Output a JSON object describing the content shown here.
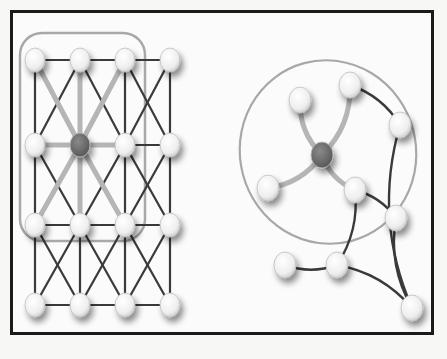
{
  "figure": {
    "background_text": "",
    "colors": {
      "frame": "#1a1a1a",
      "edge_dark": "#3a3a3a",
      "edge_highlight": "#b5b5b5",
      "node_fill": "#f2f2f2",
      "node_center": "#6e6e6e",
      "boundary": "#a8a8a8"
    }
  },
  "grid_graph": {
    "rows": 4,
    "cols": 4,
    "x": [
      35,
      80,
      125,
      170
    ],
    "y": [
      60,
      145,
      225,
      305
    ],
    "center_node": [
      1,
      1
    ],
    "neighborhood_box": {
      "x": 20,
      "y": 33,
      "w": 125,
      "h": 208,
      "r": 22
    }
  },
  "arbitrary_graph": {
    "nodes": [
      {
        "id": "center",
        "x": 322,
        "y": 155,
        "center": true
      },
      {
        "id": "a",
        "x": 300,
        "y": 100
      },
      {
        "id": "b",
        "x": 350,
        "y": 85
      },
      {
        "id": "c",
        "x": 268,
        "y": 188
      },
      {
        "id": "d",
        "x": 355,
        "y": 190
      },
      {
        "id": "e",
        "x": 400,
        "y": 125
      },
      {
        "id": "f",
        "x": 396,
        "y": 218
      },
      {
        "id": "g",
        "x": 285,
        "y": 265
      },
      {
        "id": "h",
        "x": 337,
        "y": 265
      },
      {
        "id": "i",
        "x": 412,
        "y": 308
      }
    ],
    "highlight_edges": [
      [
        "center",
        "a"
      ],
      [
        "center",
        "b"
      ],
      [
        "center",
        "c"
      ],
      [
        "center",
        "d"
      ]
    ],
    "edges": [
      [
        "b",
        "e"
      ],
      [
        "e",
        "i"
      ],
      [
        "d",
        "f"
      ],
      [
        "f",
        "i"
      ],
      [
        "d",
        "h"
      ],
      [
        "g",
        "h"
      ],
      [
        "h",
        "i"
      ]
    ],
    "neighborhood_circle": {
      "cx": 328,
      "cy": 152,
      "rx": 88,
      "ry": 92
    }
  }
}
